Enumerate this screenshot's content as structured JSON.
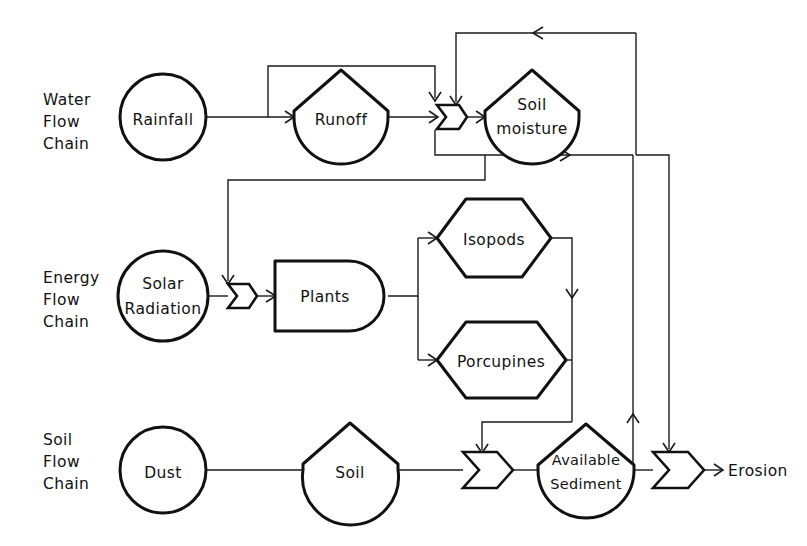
{
  "diagram": {
    "background_color": "#ffffff",
    "stroke_color": "#111111",
    "chains": [
      {
        "id": "water",
        "line1": "Water",
        "line2": "Flow",
        "line3": "Chain"
      },
      {
        "id": "energy",
        "line1": "Energy",
        "line2": "Flow",
        "line3": "Chain"
      },
      {
        "id": "soil",
        "line1": "Soil",
        "line2": "Flow",
        "line3": "Chain"
      }
    ],
    "nodes": [
      {
        "id": "rainfall",
        "label": "Rainfall",
        "shape": "circle-source",
        "chain": "water"
      },
      {
        "id": "runoff",
        "label": "Runoff",
        "shape": "pentagon-tank",
        "chain": "water"
      },
      {
        "id": "soil-moisture",
        "label_line1": "Soil",
        "label_line2": "moisture",
        "shape": "pentagon-tank",
        "chain": "water"
      },
      {
        "id": "solar-radiation",
        "label_line1": "Solar",
        "label_line2": "Radiation",
        "shape": "circle-source",
        "chain": "energy"
      },
      {
        "id": "plants",
        "label": "Plants",
        "shape": "producer-bullet",
        "chain": "energy"
      },
      {
        "id": "isopods",
        "label": "Isopods",
        "shape": "hexagon-consumer",
        "chain": "energy"
      },
      {
        "id": "porcupines",
        "label": "Porcupines",
        "shape": "hexagon-consumer",
        "chain": "energy"
      },
      {
        "id": "dust",
        "label": "Dust",
        "shape": "circle-source",
        "chain": "soil"
      },
      {
        "id": "soil",
        "label": "Soil",
        "shape": "pentagon-tank",
        "chain": "soil"
      },
      {
        "id": "available-sediment",
        "label_line1": "Available",
        "label_line2": "Sediment",
        "shape": "pentagon-tank",
        "chain": "soil"
      }
    ],
    "gates": [
      {
        "id": "gate-soil-moisture",
        "chain": "water"
      },
      {
        "id": "gate-plants",
        "chain": "energy"
      },
      {
        "id": "gate-sediment-in",
        "chain": "soil"
      },
      {
        "id": "gate-erosion",
        "chain": "soil"
      }
    ],
    "outputs": [
      {
        "id": "erosion",
        "label": "Erosion"
      }
    ]
  }
}
